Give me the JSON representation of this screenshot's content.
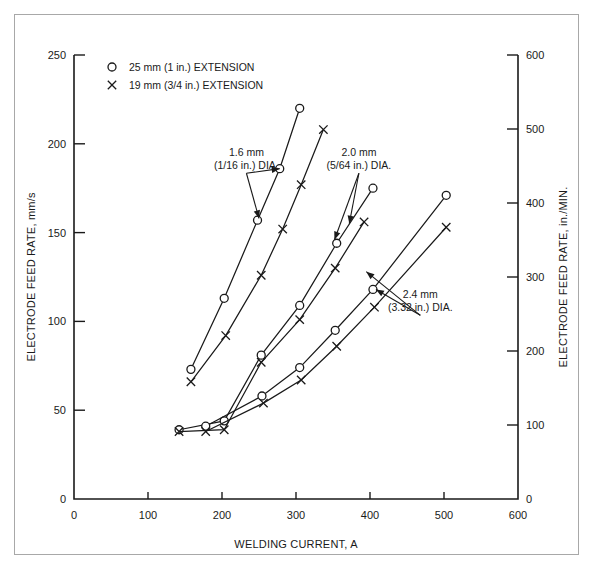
{
  "figure": {
    "background": "#ffffff",
    "ink_color": "#1a1a1a",
    "frame_color": "#a8a8a8"
  },
  "legend": {
    "entries": [
      {
        "marker": "circle-marker",
        "label": "25 mm (1 in.) EXTENSION"
      },
      {
        "marker": "cross-marker",
        "label": "19 mm (3/4 in.) EXTENSION"
      }
    ]
  },
  "chart_data": {
    "type": "line",
    "title": "",
    "xlabel": "WELDING CURRENT, A",
    "ylabel": "ELECTRODE FEED RATE, mm/s",
    "y2label": "ELECTRODE FEED RATE, in./MIN.",
    "xlim": [
      0,
      600
    ],
    "ylim": [
      0,
      250
    ],
    "y2lim": [
      0,
      600
    ],
    "xticks": [
      0,
      100,
      200,
      300,
      400,
      500,
      600
    ],
    "yticks": [
      0,
      50,
      100,
      150,
      200,
      250
    ],
    "y2ticks": [
      0,
      100,
      200,
      300,
      400,
      500,
      600
    ],
    "xticklabels": [
      "0",
      "100",
      "200",
      "300",
      "400",
      "500",
      "600"
    ],
    "yticklabels": [
      "0",
      "50",
      "100",
      "150",
      "200",
      "250"
    ],
    "y2ticklabels": [
      "0",
      "100",
      "200",
      "300",
      "400",
      "500",
      "600"
    ],
    "grid": false,
    "legend_position": "top-left",
    "series": [
      {
        "name": "1.6 mm DIA, 25 mm extension",
        "diameter": "1.6 mm",
        "extension": "25 mm (1 in.)",
        "marker": "circle-marker",
        "x": [
          158,
          203,
          248,
          278,
          305
        ],
        "y": [
          73,
          113,
          157,
          186,
          220
        ]
      },
      {
        "name": "1.6 mm DIA, 19 mm extension",
        "diameter": "1.6 mm",
        "extension": "19 mm (3/4 in.)",
        "marker": "cross-marker",
        "x": [
          158,
          205,
          253,
          282,
          307,
          337
        ],
        "y": [
          66,
          92,
          126,
          152,
          177,
          208
        ]
      },
      {
        "name": "2.0 mm DIA, 25 mm extension",
        "diameter": "2.0 mm",
        "extension": "25 mm (1 in.)",
        "marker": "circle-marker",
        "x": [
          142,
          203,
          253,
          305,
          355,
          404
        ],
        "y": [
          39,
          44,
          81,
          109,
          144,
          175
        ]
      },
      {
        "name": "2.0 mm DIA, 19 mm extension",
        "diameter": "2.0 mm",
        "extension": "19 mm (3/4 in.)",
        "marker": "cross-marker",
        "x": [
          142,
          203,
          253,
          305,
          353,
          392
        ],
        "y": [
          38,
          39,
          77,
          101,
          130,
          156
        ]
      },
      {
        "name": "2.4 mm DIA, 25 mm extension",
        "diameter": "2.4 mm",
        "extension": "25 mm (1 in.)",
        "marker": "circle-marker",
        "x": [
          178,
          254,
          305,
          353,
          404,
          503
        ],
        "y": [
          41,
          58,
          74,
          95,
          118,
          171
        ]
      },
      {
        "name": "2.4 mm DIA, 19 mm extension",
        "diameter": "2.4 mm",
        "extension": "19 mm (3/4 in.)",
        "marker": "cross-marker",
        "x": [
          178,
          256,
          307,
          355,
          406,
          503
        ],
        "y": [
          38,
          54,
          67,
          86,
          108,
          153
        ]
      }
    ],
    "annotations": [
      {
        "id": "dia-1-6",
        "text_lines": [
          "1.6 mm",
          "(1/16 in.) DIA."
        ],
        "text_x": 233,
        "text_y": 193,
        "arrow_targets": [
          [
            250,
            158
          ],
          [
            278,
            186
          ]
        ]
      },
      {
        "id": "dia-2-0",
        "text_lines": [
          "2.0 mm",
          "(5/64 in.) DIA."
        ],
        "text_x": 385,
        "text_y": 193,
        "arrow_targets": [
          [
            352,
            146
          ],
          [
            372,
            155
          ]
        ]
      },
      {
        "id": "dia-2-4",
        "text_lines": [
          "2.4 mm",
          "(3.32 in.) DIA."
        ],
        "text_x": 468,
        "text_y": 113,
        "arrow_targets": [
          [
            395,
            128
          ],
          [
            408,
            118
          ]
        ]
      }
    ]
  }
}
